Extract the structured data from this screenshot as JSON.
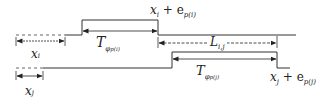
{
  "diagram": {
    "type": "timing-diagram",
    "signals": [
      {
        "name": "signal-i",
        "baseline_y": 35,
        "high_y": 20,
        "dashed_from": 16,
        "dashed_to": 65,
        "rise_x": 82,
        "fall_x": 158,
        "end_x": 296
      },
      {
        "name": "signal-j",
        "baseline_y": 68,
        "high_y": 52,
        "dashed_from": 16,
        "dashed_to": 43,
        "rise_x": 172,
        "fall_x": 277,
        "end_x": 290
      }
    ],
    "labels": {
      "x_i": {
        "base": "x",
        "sub": "i"
      },
      "x_j": {
        "base": "x",
        "sub": "j"
      },
      "T_phi_i": {
        "base": "T",
        "sub": "φ",
        "subsub": "p(i)"
      },
      "T_phi_j": {
        "base": "T",
        "sub": "φ",
        "subsub": "p(j)"
      },
      "L_ij": {
        "base": "L",
        "sub": "i,j"
      },
      "xi_plus_e": {
        "base": "x",
        "sub": "i",
        "plus": " + e",
        "esub": "p(i)"
      },
      "xj_plus_e": {
        "base": "x",
        "sub": "j",
        "plus": " + e",
        "esub": "p(j)"
      }
    },
    "colors": {
      "line": "#333333",
      "dashed": "#666666"
    }
  }
}
